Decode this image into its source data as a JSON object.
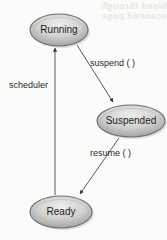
{
  "figure": {
    "kind": "state-transition-diagram",
    "background_color": "#fbfbfa",
    "ink_color": "#2a2a2a",
    "node_fill_light": "#e3e3e1",
    "node_fill_dark": "#9a9a98",
    "node_stroke": "#6e6e6c",
    "ghost_color": "#e7e6e2"
  },
  "ghost_text": {
    "line1": "bleed through",
    "line2": "scanned page"
  },
  "nodes": [
    {
      "id": "running",
      "label": "Running",
      "cx": 59,
      "cy": 30,
      "rx": 29,
      "ry": 16
    },
    {
      "id": "suspended",
      "label": "Suspended",
      "cx": 131,
      "cy": 121,
      "rx": 34,
      "ry": 16
    },
    {
      "id": "ready",
      "label": "Ready",
      "cx": 61,
      "cy": 212,
      "rx": 31,
      "ry": 16
    }
  ],
  "edges": [
    {
      "id": "suspend",
      "label": "suspend ( )",
      "from": "running",
      "to": "suspended",
      "label_x": 90,
      "label_y": 58
    },
    {
      "id": "resume",
      "label": "resume ( )",
      "from": "suspended",
      "to": "ready",
      "label_x": 90,
      "label_y": 148
    },
    {
      "id": "scheduler",
      "label": "scheduler",
      "from": "ready",
      "to": "running",
      "label_x": 9,
      "label_y": 80
    }
  ]
}
